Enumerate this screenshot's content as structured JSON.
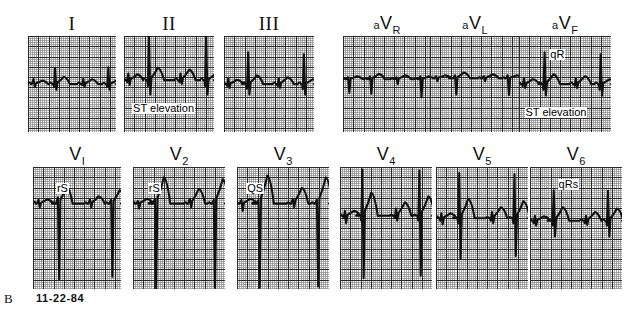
{
  "figure": {
    "panel_letter": "B",
    "date": "11-22-84",
    "kind": "12-lead-electrocardiogram",
    "paper_speed_note": "",
    "grid": {
      "fine_mm_px": 2.05,
      "bold_every": 5,
      "fine_color": "#8d8d8d",
      "bold_color": "#2a2a2a",
      "background": "#ffffff"
    },
    "trace_color": "#101010"
  },
  "rows": [
    {
      "name": "limb-and-augmented-leads",
      "leads": [
        {
          "id": "I",
          "label": "I",
          "label_style": "serif",
          "prefix": "",
          "subscript": "",
          "x": 28,
          "y": 14,
          "w": 88,
          "h": 96,
          "annotations": [],
          "waveform": {
            "baseline": 0.5,
            "beats": [
              {
                "t": 0.055,
                "p": 0.03,
                "q": 0.0,
                "r": 0.05,
                "s": 0.03,
                "tw": 0.035
              },
              {
                "t": 0.3,
                "p": 0.03,
                "q": 0.03,
                "r": 0.17,
                "s": 0.06,
                "tw": 0.075
              },
              {
                "t": 0.62,
                "p": 0.03,
                "q": 0.01,
                "r": 0.055,
                "s": 0.03,
                "tw": 0.05
              },
              {
                "t": 0.905,
                "p": 0.025,
                "q": 0.03,
                "r": 0.175,
                "s": 0.06,
                "tw": 0.04
              }
            ]
          }
        },
        {
          "id": "II",
          "label": "II",
          "label_style": "serif",
          "prefix": "",
          "subscript": "",
          "x": 124,
          "y": 14,
          "w": 90,
          "h": 96,
          "annotations": [
            {
              "text": "ST elevation",
              "x": 0.09,
              "y": 0.7,
              "size": "big",
              "name": "st-elevation-label"
            }
          ],
          "waveform": {
            "baseline": 0.46,
            "beats": [
              {
                "t": 0.04,
                "p": 0.04,
                "q": 0.02,
                "r": 0.07,
                "s": 0.05,
                "tw": 0.06
              },
              {
                "t": 0.27,
                "p": 0.045,
                "q": 0.06,
                "r": 0.48,
                "s": 0.15,
                "tw": 0.13
              },
              {
                "t": 0.62,
                "p": 0.04,
                "q": 0.02,
                "r": 0.07,
                "s": 0.04,
                "tw": 0.11
              },
              {
                "t": 0.905,
                "p": 0.04,
                "q": 0.06,
                "r": 0.47,
                "s": 0.15,
                "tw": 0.06
              }
            ]
          }
        },
        {
          "id": "III",
          "label": "III",
          "label_style": "serif",
          "prefix": "",
          "subscript": "",
          "x": 224,
          "y": 14,
          "w": 90,
          "h": 96,
          "annotations": [],
          "waveform": {
            "baseline": 0.5,
            "beats": [
              {
                "t": 0.04,
                "p": 0.03,
                "q": 0.02,
                "r": 0.06,
                "s": 0.04,
                "tw": 0.045
              },
              {
                "t": 0.26,
                "p": 0.035,
                "q": 0.05,
                "r": 0.33,
                "s": 0.11,
                "tw": 0.09
              },
              {
                "t": 0.6,
                "p": 0.03,
                "q": 0.02,
                "r": 0.06,
                "s": 0.04,
                "tw": 0.07
              },
              {
                "t": 0.88,
                "p": 0.03,
                "q": 0.055,
                "r": 0.31,
                "s": 0.11,
                "tw": 0.05
              }
            ]
          }
        },
        {
          "id": "aVR",
          "label": "V",
          "label_style": "sans",
          "prefix": "a",
          "subscript": "R",
          "x": 343,
          "y": 14,
          "w": 88,
          "h": 96,
          "annotations": [],
          "waveform": {
            "baseline": 0.45,
            "beats": [
              {
                "t": 0.05,
                "p": 0.02,
                "q": 0.0,
                "r": 0.02,
                "s": 0.14,
                "tw": 0.03
              },
              {
                "t": 0.3,
                "p": 0.02,
                "q": 0.0,
                "r": 0.03,
                "s": 0.15,
                "tw": 0.055
              },
              {
                "t": 0.6,
                "p": 0.02,
                "q": 0.0,
                "r": 0.02,
                "s": 0.05,
                "tw": 0.04
              },
              {
                "t": 0.87,
                "p": 0.02,
                "q": 0.0,
                "r": 0.03,
                "s": 0.19,
                "tw": 0.03
              }
            ]
          }
        },
        {
          "id": "aVL",
          "label": "V",
          "label_style": "sans",
          "prefix": "a",
          "subscript": "L",
          "x": 430,
          "y": 14,
          "w": 90,
          "h": 96,
          "annotations": [],
          "waveform": {
            "baseline": 0.44,
            "beats": [
              {
                "t": 0.06,
                "p": 0.02,
                "q": 0.0,
                "r": 0.02,
                "s": 0.03,
                "tw": 0.03
              },
              {
                "t": 0.27,
                "p": 0.02,
                "q": 0.0,
                "r": 0.03,
                "s": 0.17,
                "tw": 0.06
              },
              {
                "t": 0.59,
                "p": 0.02,
                "q": 0.0,
                "r": 0.02,
                "s": 0.03,
                "tw": 0.04
              },
              {
                "t": 0.855,
                "p": 0.02,
                "q": 0.0,
                "r": 0.03,
                "s": 0.175,
                "tw": 0.03
              }
            ]
          }
        },
        {
          "id": "aVF",
          "label": "V",
          "label_style": "sans",
          "prefix": "a",
          "subscript": "F",
          "x": 519,
          "y": 14,
          "w": 92,
          "h": 96,
          "annotations": [
            {
              "text": "qR",
              "x": 0.33,
              "y": 0.14,
              "size": "big",
              "name": "qr-label"
            },
            {
              "text": "ST elevation",
              "x": 0.06,
              "y": 0.74,
              "size": "big",
              "name": "st-elevation-label"
            }
          ],
          "waveform": {
            "baseline": 0.5,
            "beats": [
              {
                "t": 0.045,
                "p": 0.03,
                "q": 0.02,
                "r": 0.06,
                "s": 0.04,
                "tw": 0.05
              },
              {
                "t": 0.27,
                "p": 0.035,
                "q": 0.06,
                "r": 0.33,
                "s": 0.12,
                "tw": 0.1
              },
              {
                "t": 0.61,
                "p": 0.03,
                "q": 0.02,
                "r": 0.06,
                "s": 0.04,
                "tw": 0.08
              },
              {
                "t": 0.88,
                "p": 0.03,
                "q": 0.06,
                "r": 0.31,
                "s": 0.12,
                "tw": 0.05
              }
            ]
          }
        }
      ]
    },
    {
      "name": "precordial-leads",
      "leads": [
        {
          "id": "V1",
          "label": "V",
          "label_style": "sans",
          "prefix": "",
          "subscript": "I",
          "x": 33,
          "y": 145,
          "w": 88,
          "h": 122,
          "annotations": [
            {
              "text": "rS",
              "x": 0.26,
              "y": 0.13,
              "size": "big",
              "name": "rs-label"
            }
          ],
          "waveform": {
            "baseline": 0.3,
            "beats": [
              {
                "t": 0.055,
                "p": 0.03,
                "q": 0.0,
                "r": 0.03,
                "s": 0.03,
                "tw": 0.035
              },
              {
                "t": 0.275,
                "p": 0.02,
                "q": 0.0,
                "r": 0.05,
                "s": 0.62,
                "tw": 0.14
              },
              {
                "t": 0.64,
                "p": 0.02,
                "q": 0.0,
                "r": 0.035,
                "s": 0.03,
                "tw": 0.06
              },
              {
                "t": 0.88,
                "p": 0.02,
                "q": 0.0,
                "r": 0.03,
                "s": 0.6,
                "tw": 0.11
              }
            ]
          }
        },
        {
          "id": "V2",
          "label": "V",
          "label_style": "sans",
          "prefix": "",
          "subscript": "2",
          "x": 133,
          "y": 145,
          "w": 92,
          "h": 122,
          "annotations": [
            {
              "text": "rS",
              "x": 0.16,
              "y": 0.13,
              "size": "big",
              "name": "rs-label"
            }
          ],
          "waveform": {
            "baseline": 0.3,
            "beats": [
              {
                "t": 0.045,
                "p": 0.03,
                "q": 0.0,
                "r": 0.02,
                "s": 0.04,
                "tw": 0.04
              },
              {
                "t": 0.23,
                "p": 0.02,
                "q": 0.0,
                "r": 0.04,
                "s": 0.7,
                "tw": 0.215
              },
              {
                "t": 0.61,
                "p": 0.02,
                "q": 0.0,
                "r": 0.04,
                "s": 0.03,
                "tw": 0.12
              },
              {
                "t": 0.87,
                "p": 0.02,
                "q": 0.0,
                "r": 0.03,
                "s": 0.69,
                "tw": 0.2
              }
            ]
          }
        },
        {
          "id": "V3",
          "label": "V",
          "label_style": "sans",
          "prefix": "",
          "subscript": "3",
          "x": 237,
          "y": 145,
          "w": 92,
          "h": 122,
          "annotations": [
            {
              "text": "QS",
              "x": 0.1,
              "y": 0.13,
              "size": "big",
              "name": "qs-label"
            }
          ],
          "waveform": {
            "baseline": 0.3,
            "beats": [
              {
                "t": 0.04,
                "p": 0.03,
                "q": 0.0,
                "r": 0.03,
                "s": 0.06,
                "tw": 0.04
              },
              {
                "t": 0.225,
                "p": 0.02,
                "q": 0.0,
                "r": 0.03,
                "s": 0.69,
                "tw": 0.23
              },
              {
                "t": 0.6,
                "p": 0.02,
                "q": 0.0,
                "r": 0.04,
                "s": 0.03,
                "tw": 0.13
              },
              {
                "t": 0.86,
                "p": 0.02,
                "q": 0.0,
                "r": 0.03,
                "s": 0.68,
                "tw": 0.215
              }
            ]
          }
        },
        {
          "id": "V4",
          "label": "V",
          "label_style": "sans",
          "prefix": "",
          "subscript": "4",
          "x": 340,
          "y": 145,
          "w": 92,
          "h": 122,
          "annotations": [],
          "waveform": {
            "baseline": 0.4,
            "beats": [
              {
                "t": 0.045,
                "p": 0.03,
                "q": 0.02,
                "r": 0.04,
                "s": 0.06,
                "tw": 0.04
              },
              {
                "t": 0.235,
                "p": 0.02,
                "q": 0.04,
                "r": 0.38,
                "s": 0.51,
                "tw": 0.19
              },
              {
                "t": 0.6,
                "p": 0.02,
                "q": 0.02,
                "r": 0.06,
                "s": 0.04,
                "tw": 0.11
              },
              {
                "t": 0.855,
                "p": 0.02,
                "q": 0.04,
                "r": 0.37,
                "s": 0.49,
                "tw": 0.16
              }
            ]
          }
        },
        {
          "id": "V5",
          "label": "V",
          "label_style": "sans",
          "prefix": "",
          "subscript": "5",
          "x": 436,
          "y": 145,
          "w": 92,
          "h": 122,
          "annotations": [],
          "waveform": {
            "baseline": 0.42,
            "beats": [
              {
                "t": 0.05,
                "p": 0.03,
                "q": 0.02,
                "r": 0.04,
                "s": 0.05,
                "tw": 0.04
              },
              {
                "t": 0.245,
                "p": 0.02,
                "q": 0.04,
                "r": 0.37,
                "s": 0.33,
                "tw": 0.16
              },
              {
                "t": 0.6,
                "p": 0.02,
                "q": 0.02,
                "r": 0.05,
                "s": 0.04,
                "tw": 0.09
              },
              {
                "t": 0.845,
                "p": 0.02,
                "q": 0.04,
                "r": 0.36,
                "s": 0.31,
                "tw": 0.14
              }
            ]
          }
        },
        {
          "id": "V6",
          "label": "V",
          "label_style": "sans",
          "prefix": "",
          "subscript": "6",
          "x": 530,
          "y": 145,
          "w": 92,
          "h": 122,
          "annotations": [
            {
              "text": "qRs",
              "x": 0.3,
              "y": 0.1,
              "size": "big",
              "name": "qrs-label"
            }
          ],
          "waveform": {
            "baseline": 0.44,
            "beats": [
              {
                "t": 0.045,
                "p": 0.025,
                "q": 0.02,
                "r": 0.04,
                "s": 0.04,
                "tw": 0.035
              },
              {
                "t": 0.25,
                "p": 0.02,
                "q": 0.04,
                "r": 0.25,
                "s": 0.13,
                "tw": 0.11
              },
              {
                "t": 0.6,
                "p": 0.02,
                "q": 0.02,
                "r": 0.04,
                "s": 0.035,
                "tw": 0.07
              },
              {
                "t": 0.84,
                "p": 0.02,
                "q": 0.04,
                "r": 0.245,
                "s": 0.13,
                "tw": 0.1
              }
            ]
          }
        }
      ]
    }
  ]
}
